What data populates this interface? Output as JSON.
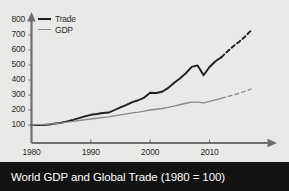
{
  "title": "World GDP and Global Trade (1980 = 100)",
  "colors": {
    "background": "#e9e9e7",
    "title_bar": "#121212",
    "title_text": "#ffffff",
    "trade_line": "#1f1f1f",
    "gdp_line": "#8a8a8a",
    "axis": "#6e6e6e",
    "tick_text": "#2b2b2b"
  },
  "legend": {
    "position": "top-left",
    "items": [
      {
        "label": "Trade",
        "color": "#1f1f1f",
        "name": "trade"
      },
      {
        "label": "GDP",
        "color": "#8a8a8a",
        "name": "gdp"
      }
    ]
  },
  "axes": {
    "y_ticks": [
      "800",
      "700",
      "600",
      "500",
      "400",
      "300",
      "200",
      "100"
    ],
    "x_ticks": [
      "1980",
      "1990",
      "2000",
      "2010"
    ]
  },
  "chart_data": {
    "type": "line",
    "title": "World GDP and Global Trade (1980 = 100)",
    "xlabel": "",
    "ylabel": "",
    "xlim": [
      1980,
      2018
    ],
    "ylim": [
      0,
      800
    ],
    "grid": false,
    "legend_position": "top-left",
    "x_tick_values": [
      1980,
      1990,
      2000,
      2010
    ],
    "y_tick_values": [
      100,
      200,
      300,
      400,
      500,
      600,
      700,
      800
    ],
    "annotations": [
      "Dashed segments after 2012 indicate projected values",
      "Trade shows a sharp contraction around 2008-2009"
    ],
    "series": [
      {
        "name": "Trade",
        "color": "#1f1f1f",
        "solid_until": 2012,
        "dashed_from": 2012,
        "x": [
          1980,
          1981,
          1982,
          1983,
          1984,
          1985,
          1986,
          1987,
          1988,
          1989,
          1990,
          1991,
          1992,
          1993,
          1994,
          1995,
          1996,
          1997,
          1998,
          1999,
          2000,
          2001,
          2002,
          2003,
          2004,
          2005,
          2006,
          2007,
          2008,
          2009,
          2010,
          2011,
          2012,
          2013,
          2014,
          2015,
          2016,
          2017
        ],
        "values": [
          100,
          101,
          100,
          103,
          110,
          115,
          124,
          134,
          146,
          157,
          168,
          173,
          180,
          183,
          200,
          218,
          234,
          253,
          265,
          283,
          315,
          313,
          322,
          346,
          380,
          410,
          445,
          487,
          497,
          432,
          487,
          525,
          552,
          590,
          625,
          655,
          690,
          730
        ]
      },
      {
        "name": "GDP",
        "color": "#8a8a8a",
        "solid_until": 2012,
        "dashed_from": 2012,
        "x": [
          1980,
          1981,
          1982,
          1983,
          1984,
          1985,
          1986,
          1987,
          1988,
          1989,
          1990,
          1991,
          1992,
          1993,
          1994,
          1995,
          1996,
          1997,
          1998,
          1999,
          2000,
          2001,
          2002,
          2003,
          2004,
          2005,
          2006,
          2007,
          2008,
          2009,
          2010,
          2011,
          2012,
          2013,
          2014,
          2015,
          2016,
          2017
        ],
        "values": [
          100,
          102,
          103,
          106,
          110,
          114,
          119,
          124,
          130,
          135,
          140,
          145,
          150,
          154,
          161,
          168,
          174,
          181,
          186,
          192,
          200,
          205,
          210,
          217,
          226,
          235,
          245,
          252,
          253,
          247,
          258,
          268,
          278,
          289,
          300,
          312,
          325,
          340
        ]
      }
    ]
  }
}
